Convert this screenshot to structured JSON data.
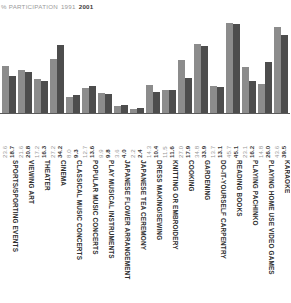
{
  "header": {
    "title": "% PARTICIPATION",
    "legend_1991": "1991",
    "legend_2001": "2001"
  },
  "colors": {
    "series_1991": "#8c8c8c",
    "series_2001": "#4d4d4d",
    "title_text": "#9a9a9a",
    "label_text": "#2e2e2e",
    "baseline": "#5a5a5a"
  },
  "chart_data": {
    "type": "bar",
    "title": "% PARTICIPATION 1991 2001",
    "xlabel": "",
    "ylabel": "% Participation",
    "ylim": [
      0,
      50
    ],
    "grid": false,
    "legend_position": "title-inline",
    "categories": [
      "SPORTS/SPORTING EVENTS",
      "VIEWING ART",
      "THEATER",
      "CINEMA",
      "CLASSICAL MUSIC CONCERTS",
      "POPULAR MUSIC CONCERTS",
      "PLAY MUSICAL INSTRUMENTS",
      "JAPANESE FLOWER ARRANGEMENT",
      "JAPANESE TEA CEREMONY",
      "DRESS MAKING/SEWING",
      "KNITTING OR EMBROIDERY",
      "COOKING",
      "GARDENING",
      "DO-IT-YOURSELF CARPENTRY",
      "READING BOOKS",
      "PLAYING PACHINKO",
      "PLAYING HOME USE VIDEO GAMES",
      "KARAOKE"
    ],
    "series": [
      {
        "name": "1991",
        "color": "#8c8c8c",
        "values": [
          23.6,
          21.6,
          17.2,
          27.2,
          8.0,
          12.7,
          9.9,
          3.6,
          2.2,
          14.3,
          11.5,
          27.0,
          34.8,
          13.7,
          45.7,
          23.1,
          14.8,
          43.6
        ],
        "labels": [
          "23.6",
          "21.6",
          "17.2",
          "27.2",
          "8.0",
          "12.7",
          "9.9",
          "3.6",
          "2.2",
          "14.3",
          "11.5",
          "27.0",
          "34.8",
          "13.7",
          "45.7",
          "23.1",
          "14.8",
          "43.6"
        ]
      },
      {
        "name": "2001",
        "color": "#4d4d4d",
        "values": [
          18.7,
          20.8,
          16.3,
          34.2,
          9.3,
          13.6,
          9.8,
          4.0,
          2.4,
          10.4,
          11.6,
          17.9,
          33.9,
          13.1,
          45.1,
          16.2,
          26.0,
          39.5
        ],
        "labels": [
          "18.7",
          "20.8",
          "16.3",
          "34.2",
          "9.3",
          "13.6",
          "9.8",
          "4.0",
          "2.4",
          "10.4",
          "11.6",
          "17.9",
          "33.9",
          "13.1",
          "45.1",
          "16.2",
          "26.0",
          "39.5"
        ]
      }
    ]
  }
}
